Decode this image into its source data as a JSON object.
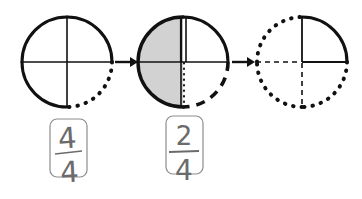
{
  "diagram": {
    "background_color": "#ffffff",
    "ink_color": "#111111",
    "shade_color": "#d2d2d2",
    "card_border_color": "#888888",
    "pencil_color": "#6b6b6b",
    "steps": [
      {
        "id": "step-1",
        "label": "Circle one: four quarters, bottom-right arc dotted",
        "center_x": 67,
        "center_y": 62,
        "radius": 45,
        "shaded_quadrants": [],
        "quadrant_arcs": {
          "top_right": "solid",
          "bottom_right": "dotted",
          "bottom_left": "solid",
          "top_left": "solid"
        },
        "radii": {
          "up": "solid",
          "right": "solid",
          "down": "solid",
          "left": "solid"
        },
        "fraction": {
          "numerator": "4",
          "denominator": "4",
          "card_x": 50,
          "card_y": 119,
          "card_w": 37,
          "card_h": 58
        }
      },
      {
        "id": "step-2",
        "label": "Circle two: left half shaded, bottom-right quadrant dashed",
        "center_x": 183,
        "center_y": 62,
        "radius": 45,
        "shaded_quadrants": [
          "top_left",
          "bottom_left"
        ],
        "quadrant_arcs": {
          "top_right": "solid",
          "bottom_right": "dashed",
          "bottom_left": "solid",
          "top_left": "solid"
        },
        "radii": {
          "up": "solid",
          "right": "solid",
          "down": "dotted",
          "left": "solid"
        },
        "fraction": {
          "numerator": "2",
          "denominator": "4",
          "card_x": 166,
          "card_y": 116,
          "card_w": 37,
          "card_h": 58
        }
      },
      {
        "id": "step-3",
        "label": "Circle three: only top-right quarter solid, remainder dotted",
        "center_x": 302,
        "center_y": 62,
        "radius": 45,
        "shaded_quadrants": [],
        "quadrant_arcs": {
          "top_right": "solid",
          "bottom_right": "dotted",
          "bottom_left": "dotted",
          "top_left": "dotted"
        },
        "radii": {
          "up": "solid",
          "right": "solid",
          "down": "dotted",
          "left": "dotted"
        },
        "fraction": null
      }
    ],
    "arrows": [
      {
        "id": "arrow-1",
        "from_step": "step-1",
        "to_step": "step-2",
        "x1": 114,
        "x2": 136,
        "y": 62
      },
      {
        "id": "arrow-2",
        "from_step": "step-2",
        "to_step": "step-3",
        "x1": 231,
        "x2": 253,
        "y": 62
      }
    ]
  }
}
